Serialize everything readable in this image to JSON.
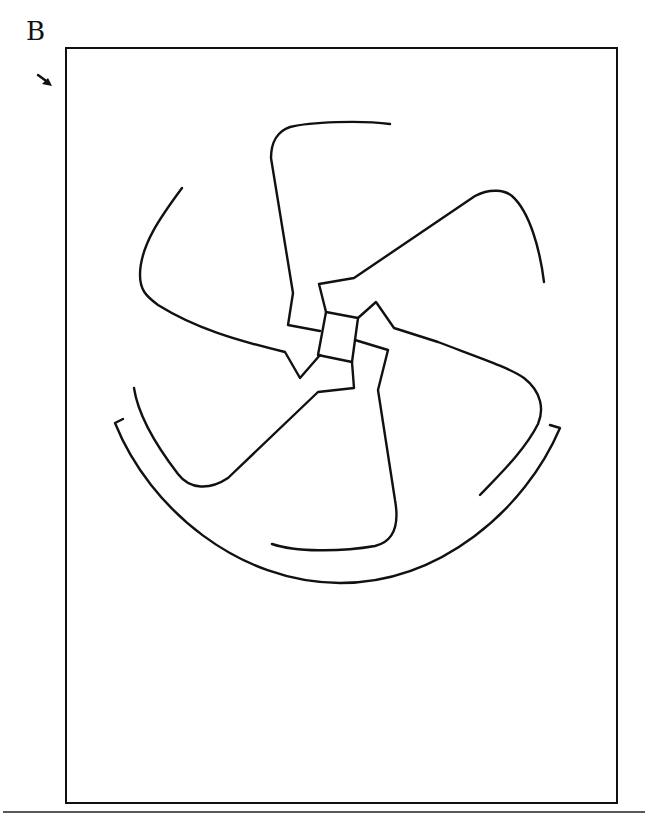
{
  "figure": {
    "panel_label": "B",
    "arrow_icon": "arrow-down-right-icon",
    "colors": {
      "ink": "#111111",
      "background": "#ffffff"
    },
    "elements": [
      {
        "name": "central-square"
      },
      {
        "name": "arm-top"
      },
      {
        "name": "arm-right-top"
      },
      {
        "name": "arm-right"
      },
      {
        "name": "arm-bottom"
      },
      {
        "name": "arm-bottom-left"
      },
      {
        "name": "arm-left"
      },
      {
        "name": "outer-arc"
      }
    ]
  }
}
